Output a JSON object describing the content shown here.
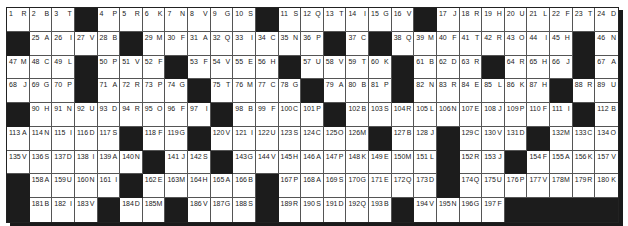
{
  "puzzle": {
    "columns": 27,
    "rows": 9,
    "colors": {
      "black_cell": "#1c1c1c",
      "white_cell": "#ffffff",
      "grid_line": "#555555",
      "text": "#222222"
    },
    "grid": [
      [
        [
          "1",
          "R"
        ],
        [
          "2",
          "B"
        ],
        [
          "3",
          "T"
        ],
        null,
        [
          "4",
          "P"
        ],
        [
          "5",
          "R"
        ],
        [
          "6",
          "K"
        ],
        [
          "7",
          "N"
        ],
        [
          "8",
          "V"
        ],
        [
          "9",
          "G"
        ],
        [
          "10",
          "S"
        ],
        null,
        [
          "11",
          "S"
        ],
        [
          "12",
          "Q"
        ],
        [
          "13",
          "T"
        ],
        [
          "14",
          "I"
        ],
        [
          "15",
          "G"
        ],
        [
          "16",
          "V"
        ],
        null,
        [
          "17",
          "J"
        ],
        [
          "18",
          "R"
        ],
        [
          "19",
          "H"
        ],
        [
          "20",
          "U"
        ],
        [
          "21",
          "L"
        ],
        [
          "22",
          "F"
        ],
        [
          "23",
          "T"
        ],
        [
          "24",
          "D"
        ]
      ],
      [
        null,
        [
          "25",
          "A"
        ],
        [
          "26",
          "I"
        ],
        [
          "27",
          "V"
        ],
        [
          "28",
          "B"
        ],
        null,
        [
          "29",
          "M"
        ],
        [
          "30",
          "F"
        ],
        [
          "31",
          "A"
        ],
        [
          "32",
          "Q"
        ],
        [
          "33",
          "I"
        ],
        [
          "34",
          "C"
        ],
        [
          "35",
          "N"
        ],
        [
          "36",
          "P"
        ],
        null,
        [
          "37",
          "C"
        ],
        null,
        [
          "38",
          "Q"
        ],
        [
          "39",
          "M"
        ],
        [
          "40",
          "F"
        ],
        [
          "41",
          "T"
        ],
        [
          "42",
          "R"
        ],
        [
          "43",
          "O"
        ],
        [
          "44",
          "I"
        ],
        [
          "45",
          "H"
        ],
        null,
        [
          "46",
          "N"
        ]
      ],
      [
        [
          "47",
          "M"
        ],
        [
          "48",
          "C"
        ],
        [
          "49",
          "L"
        ],
        null,
        [
          "50",
          "P"
        ],
        [
          "51",
          "V"
        ],
        [
          "52",
          "F"
        ],
        null,
        [
          "53",
          "F"
        ],
        [
          "54",
          "V"
        ],
        [
          "55",
          "E"
        ],
        [
          "56",
          "H"
        ],
        null,
        [
          "57",
          "U"
        ],
        [
          "58",
          "V"
        ],
        [
          "59",
          "T"
        ],
        [
          "60",
          "K"
        ],
        null,
        [
          "61",
          "B"
        ],
        [
          "62",
          "D"
        ],
        [
          "63",
          "R"
        ],
        null,
        [
          "64",
          "R"
        ],
        [
          "65",
          "H"
        ],
        [
          "66",
          "J"
        ],
        null,
        [
          "67",
          "A"
        ]
      ],
      [
        [
          "68",
          "J"
        ],
        [
          "69",
          "G"
        ],
        [
          "70",
          "P"
        ],
        null,
        [
          "71",
          "A"
        ],
        [
          "72",
          "R"
        ],
        [
          "73",
          "P"
        ],
        [
          "74",
          "G"
        ],
        null,
        [
          "75",
          "T"
        ],
        [
          "76",
          "M"
        ],
        [
          "77",
          "C"
        ],
        [
          "78",
          "G"
        ],
        null,
        [
          "79",
          "A"
        ],
        [
          "80",
          "B"
        ],
        [
          "81",
          "P"
        ],
        null,
        [
          "82",
          "N"
        ],
        [
          "83",
          "R"
        ],
        [
          "84",
          "E"
        ],
        [
          "85",
          "L"
        ],
        [
          "86",
          "K"
        ],
        [
          "87",
          "H"
        ],
        null,
        [
          "88",
          "R"
        ],
        [
          "89",
          "U"
        ]
      ],
      [
        null,
        [
          "90",
          "H"
        ],
        [
          "91",
          "N"
        ],
        [
          "92",
          "U"
        ],
        [
          "93",
          "D"
        ],
        [
          "94",
          "R"
        ],
        [
          "95",
          "O"
        ],
        [
          "96",
          "F"
        ],
        [
          "97",
          "I"
        ],
        null,
        [
          "98",
          "B"
        ],
        [
          "99",
          "F"
        ],
        [
          "100",
          "C"
        ],
        [
          "101",
          "P"
        ],
        null,
        [
          "102",
          "B"
        ],
        [
          "103",
          "S"
        ],
        [
          "104",
          "R"
        ],
        [
          "105",
          "L"
        ],
        [
          "106",
          "N"
        ],
        [
          "107",
          "E"
        ],
        [
          "108",
          "J"
        ],
        [
          "109",
          "P"
        ],
        [
          "110",
          "F"
        ],
        [
          "111",
          "I"
        ],
        null,
        [
          "112",
          "B"
        ]
      ],
      [
        [
          "113",
          "A"
        ],
        [
          "114",
          "N"
        ],
        [
          "115",
          "I"
        ],
        [
          "116",
          "D"
        ],
        [
          "117",
          "S"
        ],
        null,
        [
          "118",
          "F"
        ],
        [
          "119",
          "G"
        ],
        null,
        [
          "120",
          "V"
        ],
        [
          "121",
          "I"
        ],
        [
          "122",
          "U"
        ],
        [
          "123",
          "S"
        ],
        [
          "124",
          "C"
        ],
        [
          "125",
          "O"
        ],
        [
          "126",
          "M"
        ],
        null,
        [
          "127",
          "B"
        ],
        [
          "128",
          "J"
        ],
        null,
        [
          "129",
          "C"
        ],
        [
          "130",
          "V"
        ],
        [
          "131",
          "D"
        ],
        null,
        [
          "132",
          "M"
        ],
        [
          "133",
          "C"
        ],
        [
          "134",
          "O"
        ]
      ],
      [
        [
          "135",
          "V"
        ],
        [
          "136",
          "S"
        ],
        [
          "137",
          "D"
        ],
        [
          "138",
          "I"
        ],
        [
          "139",
          "A"
        ],
        [
          "140",
          "N"
        ],
        null,
        [
          "141",
          "J"
        ],
        [
          "142",
          "S"
        ],
        null,
        [
          "143",
          "G"
        ],
        [
          "144",
          "V"
        ],
        [
          "145",
          "H"
        ],
        [
          "146",
          "A"
        ],
        [
          "147",
          "P"
        ],
        [
          "148",
          "K"
        ],
        [
          "149",
          "E"
        ],
        [
          "150",
          "M"
        ],
        [
          "151",
          "L"
        ],
        null,
        [
          "152",
          "R"
        ],
        [
          "153",
          "J"
        ],
        null,
        [
          "154",
          "F"
        ],
        [
          "155",
          "A"
        ],
        [
          "156",
          "K"
        ],
        [
          "157",
          "V"
        ]
      ],
      [
        null,
        [
          "158",
          "A"
        ],
        [
          "159",
          "U"
        ],
        [
          "160",
          "N"
        ],
        [
          "161",
          "I"
        ],
        null,
        [
          "162",
          "E"
        ],
        [
          "163",
          "M"
        ],
        [
          "164",
          "H"
        ],
        [
          "165",
          "A"
        ],
        [
          "166",
          "B"
        ],
        null,
        [
          "167",
          "P"
        ],
        [
          "168",
          "A"
        ],
        [
          "169",
          "S"
        ],
        [
          "170",
          "G"
        ],
        [
          "171",
          "E"
        ],
        [
          "172",
          "Q"
        ],
        [
          "173",
          "D"
        ],
        null,
        [
          "174",
          "Q"
        ],
        [
          "175",
          "U"
        ],
        [
          "176",
          "P"
        ],
        [
          "177",
          "V"
        ],
        [
          "178",
          "M"
        ],
        [
          "179",
          "R"
        ],
        [
          "180",
          "K"
        ]
      ],
      [
        null,
        [
          "181",
          "B"
        ],
        [
          "182",
          "I"
        ],
        [
          "183",
          "V"
        ],
        null,
        [
          "184",
          "D"
        ],
        [
          "185",
          "M"
        ],
        null,
        [
          "186",
          "V"
        ],
        [
          "187",
          "G"
        ],
        [
          "188",
          "S"
        ],
        null,
        [
          "189",
          "R"
        ],
        [
          "190",
          "S"
        ],
        [
          "191",
          "D"
        ],
        [
          "192",
          "Q"
        ],
        [
          "193",
          "B"
        ],
        null,
        [
          "194",
          "V"
        ],
        [
          "195",
          "N"
        ],
        [
          "196",
          "G"
        ],
        [
          "197",
          "F"
        ],
        null,
        null,
        null,
        null,
        null
      ]
    ]
  }
}
